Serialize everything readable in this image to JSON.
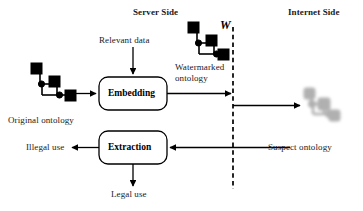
{
  "diagram": {
    "title_server": "Server Side",
    "title_internet": "Internet Side",
    "labels": {
      "relevant_data": "Relevant data",
      "original_ontology": "Original ontology",
      "watermarked_ontology": "Watermarked ontology",
      "watermark_symbol": "W",
      "suspect_ontology": "Suspect ontology",
      "illegal_use": "Illegal use",
      "legal_use": "Legal use"
    },
    "boxes": {
      "embedding": "Embedding",
      "extraction": "Extraction"
    },
    "colors": {
      "stroke": "#000000",
      "text": "#1a1a1a",
      "node_fill": "#000000",
      "ghost_fill": "#7d7d7d",
      "background": "#ffffff"
    }
  }
}
